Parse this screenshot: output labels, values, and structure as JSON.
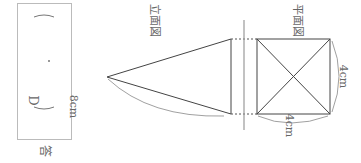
{
  "answer": {
    "label": "答",
    "choice_prefix": "D",
    "paren_open": "(",
    "paren_close": ")",
    "dot": "・"
  },
  "front_view": {
    "title": "立面図",
    "slant_length": "8cm"
  },
  "plan_view": {
    "title": "平面図",
    "side_length_bottom": "4cm",
    "side_length_right": "4cm"
  },
  "colors": {
    "line": "#444444",
    "guide": "#999999",
    "text": "#666666"
  }
}
